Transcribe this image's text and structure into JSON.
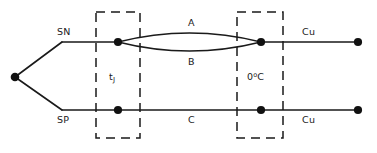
{
  "diagram": {
    "type": "electrical-schematic",
    "colors": {
      "line": "#1a1a1a",
      "node": "#111111",
      "background": "#ffffff"
    },
    "labels": {
      "sn": "SN",
      "sp": "SP",
      "conductor_a": "A",
      "conductor_b": "B",
      "conductor_c": "C",
      "junction_block": "t",
      "junction_block_sub": "J",
      "reference_block_value": "0",
      "reference_block_degree": "o",
      "reference_block_unit": "C",
      "copper_top": "Cu",
      "copper_bottom": "Cu"
    },
    "geometry": {
      "left_vertex": {
        "x": 15,
        "y": 77
      },
      "upper_rail_y": 42,
      "lower_rail_y": 110,
      "junction_left_x": 118,
      "junction_right_x": 261,
      "terminal_x": 358,
      "rail_start_x": 62,
      "lens_bulge": 14,
      "dashed_box_left": {
        "x": 96,
        "y": 12,
        "width": 44,
        "height": 126
      },
      "dashed_box_right": {
        "x": 237,
        "y": 12,
        "width": 46,
        "height": 126
      },
      "node_radius": 4.1,
      "terminal_radius": 4.1
    }
  }
}
